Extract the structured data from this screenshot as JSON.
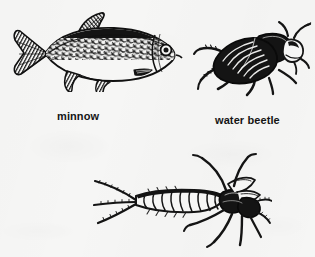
{
  "figure": {
    "background_color": "#f6f6f5",
    "ink_color": "#141414",
    "style": "black-and-white scanned line drawing"
  },
  "specimens": [
    {
      "id": "minnow",
      "icon": "fish-illustration",
      "caption": "minnow",
      "caption_visible": true,
      "orientation": "facing right",
      "features": "forked caudal fin, triangular dorsal fin, pelvic and anal fins, speckled dark dorsal surface, pale belly, visible eye and gill cover"
    },
    {
      "id": "water-beetle",
      "icon": "beetle-illustration",
      "caption": "water beetle",
      "caption_visible": true,
      "orientation": "head to the upper right",
      "features": "solid black oval elytra with longitudinal striations, six legs, short antennae"
    },
    {
      "id": "insect-larva",
      "icon": "insect-larva-illustration",
      "caption": "",
      "caption_visible": false,
      "orientation": "head to the right",
      "features": "segmented abdomen of about ten segments, three long tail filaments (cerci) at left, six legs and two antennae at the head"
    }
  ],
  "captions": {
    "minnow": "minnow",
    "water_beetle": "water beetle"
  }
}
